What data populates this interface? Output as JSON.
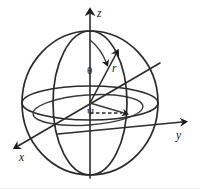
{
  "figure": {
    "type": "diagram",
    "background_color": "#ffffff",
    "line_color": "#2b2b2b",
    "labels": {
      "z_axis": "z",
      "y_axis": "y",
      "x_axis": "x",
      "radius": "r",
      "polar_angle": "θ",
      "azimuth_angle": "ψ"
    },
    "geometry": {
      "center": {
        "x": 90,
        "y": 103
      },
      "sphere_radius_x": 68,
      "sphere_radius_y": 72,
      "equator_ellipse_ry": 17,
      "meridian_ellipse_rx": 37,
      "z_axis_tip": {
        "x": 90,
        "y": 9
      },
      "z_axis_base": {
        "x": 90,
        "y": 178
      },
      "y_axis_tip": {
        "x": 188,
        "y": 122
      },
      "x_axis_tip": {
        "x": 12,
        "y": 150
      },
      "r_vector_tip": {
        "x": 119,
        "y": 50
      },
      "azimuth_arrow_tip": {
        "x": 129,
        "y": 113
      }
    }
  }
}
